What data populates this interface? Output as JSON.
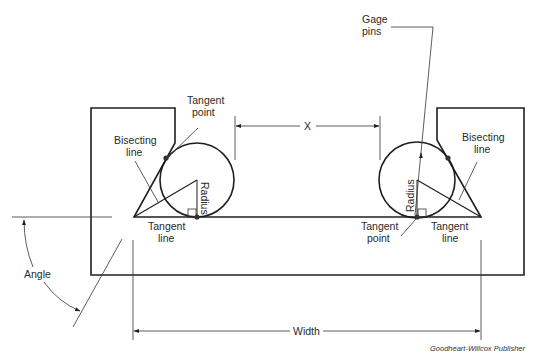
{
  "figure": {
    "type": "technical-diagram",
    "labels": {
      "gage_pins_1": "Gage",
      "gage_pins_2": "pins",
      "tangent_point_top_1": "Tangent",
      "tangent_point_top_2": "point",
      "bisecting_left_1": "Bisecting",
      "bisecting_left_2": "line",
      "bisecting_right_1": "Bisecting",
      "bisecting_right_2": "line",
      "radius_left": "Radius",
      "radius_right": "Radius",
      "tangent_line_left_1": "Tangent",
      "tangent_line_left_2": "line",
      "tangent_line_right_1": "Tangent",
      "tangent_line_right_2": "line",
      "tangent_point_bottom_1": "Tangent",
      "tangent_point_bottom_2": "point",
      "dimension_x": "X",
      "dimension_width": "Width",
      "angle": "Angle"
    },
    "credit": "Goodheart-Willcox Publisher",
    "colors": {
      "line": "#1f1f1f",
      "text": "#2a2a2a",
      "background": "#ffffff"
    }
  }
}
